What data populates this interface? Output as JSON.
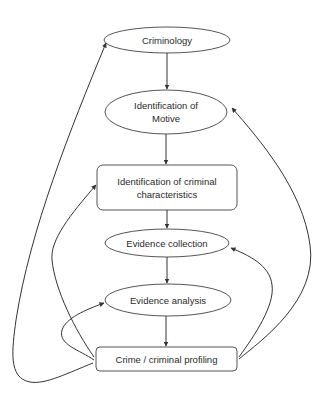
{
  "diagram": {
    "type": "flowchart",
    "colors": {
      "line": "#333333",
      "text": "#2a2a2a",
      "background": "#ffffff"
    },
    "nodes": [
      {
        "id": "criminology",
        "shape": "ellipse",
        "label": "Criminology"
      },
      {
        "id": "motive",
        "shape": "ellipse",
        "label_line1": "Identification of",
        "label_line2": "Motive"
      },
      {
        "id": "characteristics",
        "shape": "rounded-rect",
        "label_line1": "Identification of criminal",
        "label_line2": "characteristics"
      },
      {
        "id": "evidence_collection",
        "shape": "ellipse",
        "label": "Evidence collection"
      },
      {
        "id": "evidence_analysis",
        "shape": "ellipse",
        "label": "Evidence analysis"
      },
      {
        "id": "profiling",
        "shape": "rounded-rect",
        "label": "Crime / criminal profiling"
      }
    ],
    "edges": [
      {
        "from": "criminology",
        "to": "motive",
        "style": "straight"
      },
      {
        "from": "motive",
        "to": "characteristics",
        "style": "straight"
      },
      {
        "from": "characteristics",
        "to": "evidence_collection",
        "style": "straight"
      },
      {
        "from": "evidence_collection",
        "to": "evidence_analysis",
        "style": "straight"
      },
      {
        "from": "evidence_analysis",
        "to": "profiling",
        "style": "straight"
      },
      {
        "from": "profiling",
        "to": "criminology",
        "style": "curved-feedback-left"
      },
      {
        "from": "profiling",
        "to": "characteristics",
        "style": "curved-feedback-left"
      },
      {
        "from": "profiling",
        "to": "evidence_analysis",
        "style": "curved-feedback-left"
      },
      {
        "from": "profiling",
        "to": "motive",
        "style": "curved-feedback-right"
      },
      {
        "from": "profiling",
        "to": "evidence_collection",
        "style": "curved-feedback-right"
      }
    ]
  }
}
